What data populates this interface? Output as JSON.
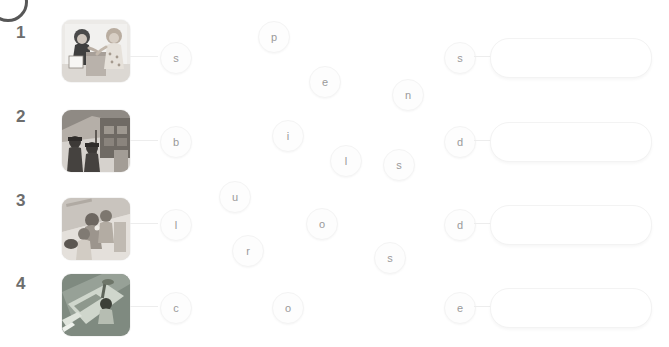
{
  "worksheet": {
    "title": "Letter bubble spelling worksheet",
    "corner_badge": "circle-badge",
    "colors": {
      "row_number": "#6d6d6d",
      "bubble_text": "#9a9a9a",
      "bubble_fill": "#fdfdfd",
      "answer_box_border": "#f3f3f3",
      "connector": "#ededed",
      "background": "#ffffff"
    },
    "rows": [
      {
        "number": "1",
        "image_alt": "two children at a counter",
        "answer_value": "",
        "answer_placeholder": "",
        "letters": [
          {
            "char": "s",
            "x": 160,
            "y": 42,
            "linked": true
          },
          {
            "char": "p",
            "x": 258,
            "y": 21,
            "linked": false
          },
          {
            "char": "e",
            "x": 309,
            "y": 66,
            "linked": false
          },
          {
            "char": "n",
            "x": 392,
            "y": 79,
            "linked": false
          },
          {
            "char": "s",
            "x": 444,
            "y": 42,
            "linked": true
          }
        ]
      },
      {
        "number": "2",
        "image_alt": "children at a market stall",
        "answer_value": "",
        "answer_placeholder": "",
        "letters": [
          {
            "char": "b",
            "x": 160,
            "y": 126,
            "linked": true
          },
          {
            "char": "i",
            "x": 272,
            "y": 120,
            "linked": false
          },
          {
            "char": "l",
            "x": 330,
            "y": 145,
            "linked": false
          },
          {
            "char": "s",
            "x": 383,
            "y": 149,
            "linked": false
          },
          {
            "char": "d",
            "x": 444,
            "y": 126,
            "linked": true
          }
        ]
      },
      {
        "number": "3",
        "image_alt": "children outdoors",
        "answer_value": "",
        "answer_placeholder": "",
        "letters": [
          {
            "char": "u",
            "x": 219,
            "y": 181,
            "linked": false
          },
          {
            "char": "l",
            "x": 160,
            "y": 209,
            "linked": true
          },
          {
            "char": "o",
            "x": 306,
            "y": 208,
            "linked": false
          },
          {
            "char": "r",
            "x": 232,
            "y": 235,
            "linked": false
          },
          {
            "char": "s",
            "x": 374,
            "y": 242,
            "linked": false
          },
          {
            "char": "d",
            "x": 444,
            "y": 209,
            "linked": true
          }
        ]
      },
      {
        "number": "4",
        "image_alt": "aerial view of a playground court",
        "answer_value": "",
        "answer_placeholder": "",
        "letters": [
          {
            "char": "c",
            "x": 160,
            "y": 292,
            "linked": true
          },
          {
            "char": "o",
            "x": 272,
            "y": 292,
            "linked": false
          },
          {
            "char": "e",
            "x": 444,
            "y": 292,
            "linked": true
          }
        ]
      }
    ],
    "row_geometry": [
      {
        "number_x": 16,
        "number_y": 24,
        "thumb_x": 62,
        "thumb_y": 20,
        "answer_x": 490,
        "answer_y": 38
      },
      {
        "number_x": 16,
        "number_y": 108,
        "thumb_x": 62,
        "thumb_y": 110,
        "answer_x": 490,
        "answer_y": 122
      },
      {
        "number_x": 16,
        "number_y": 192,
        "thumb_x": 62,
        "thumb_y": 198,
        "answer_x": 490,
        "answer_y": 205
      },
      {
        "number_x": 16,
        "number_y": 275,
        "thumb_x": 62,
        "thumb_y": 274,
        "answer_x": 490,
        "answer_y": 288
      }
    ]
  }
}
